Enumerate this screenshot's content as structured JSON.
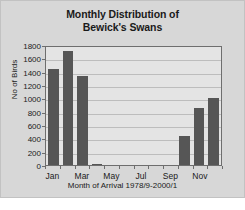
{
  "chart_data": {
    "type": "bar",
    "title": "Monthly Distribution of Bewick's Swans",
    "title_lines": [
      "Monthly Distribution of",
      "Bewick's Swans"
    ],
    "xlabel": "Month of Arrival 1978/9-2000/1",
    "ylabel": "No of Birds",
    "categories": [
      "Jan",
      "Feb",
      "Mar",
      "Apr",
      "May",
      "Jun",
      "Jul",
      "Aug",
      "Sep",
      "Oct",
      "Nov",
      "Dec"
    ],
    "tick_labels": [
      "Jan",
      "",
      "Mar",
      "",
      "May",
      "",
      "Jul",
      "",
      "Sep",
      "",
      "Nov",
      ""
    ],
    "values": [
      1440,
      1710,
      1330,
      20,
      0,
      0,
      0,
      0,
      0,
      430,
      850,
      1000
    ],
    "ylim": [
      0,
      1800
    ],
    "yticks": [
      0,
      200,
      400,
      600,
      800,
      1000,
      1200,
      1400,
      1600,
      1800
    ],
    "ytick_labels": [
      "0",
      "200",
      "400",
      "600",
      "800",
      "1000",
      "1200",
      "1400",
      "1600",
      "1800"
    ],
    "grid": true,
    "legend": false,
    "bar_color": "#565656",
    "plot_bg": "#e4e4e4",
    "figure_bg": "#d7d7d7",
    "axis_color": "#6e6e6e",
    "grid_color": "#bdbdbd"
  }
}
